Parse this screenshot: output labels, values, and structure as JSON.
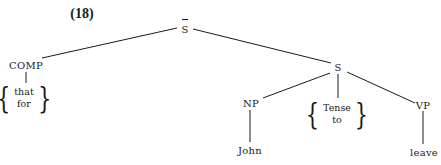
{
  "example_number": "(18)",
  "tree": {
    "root": {
      "label": "S",
      "overbar": true
    },
    "comp": {
      "label": "COMP",
      "options": [
        "that",
        "for"
      ]
    },
    "s": {
      "label": "S"
    },
    "np": {
      "label": "NP",
      "terminal": "John"
    },
    "tense": {
      "options": [
        "Tense",
        "to"
      ]
    },
    "vp": {
      "label": "VP",
      "terminal": "leave"
    }
  }
}
